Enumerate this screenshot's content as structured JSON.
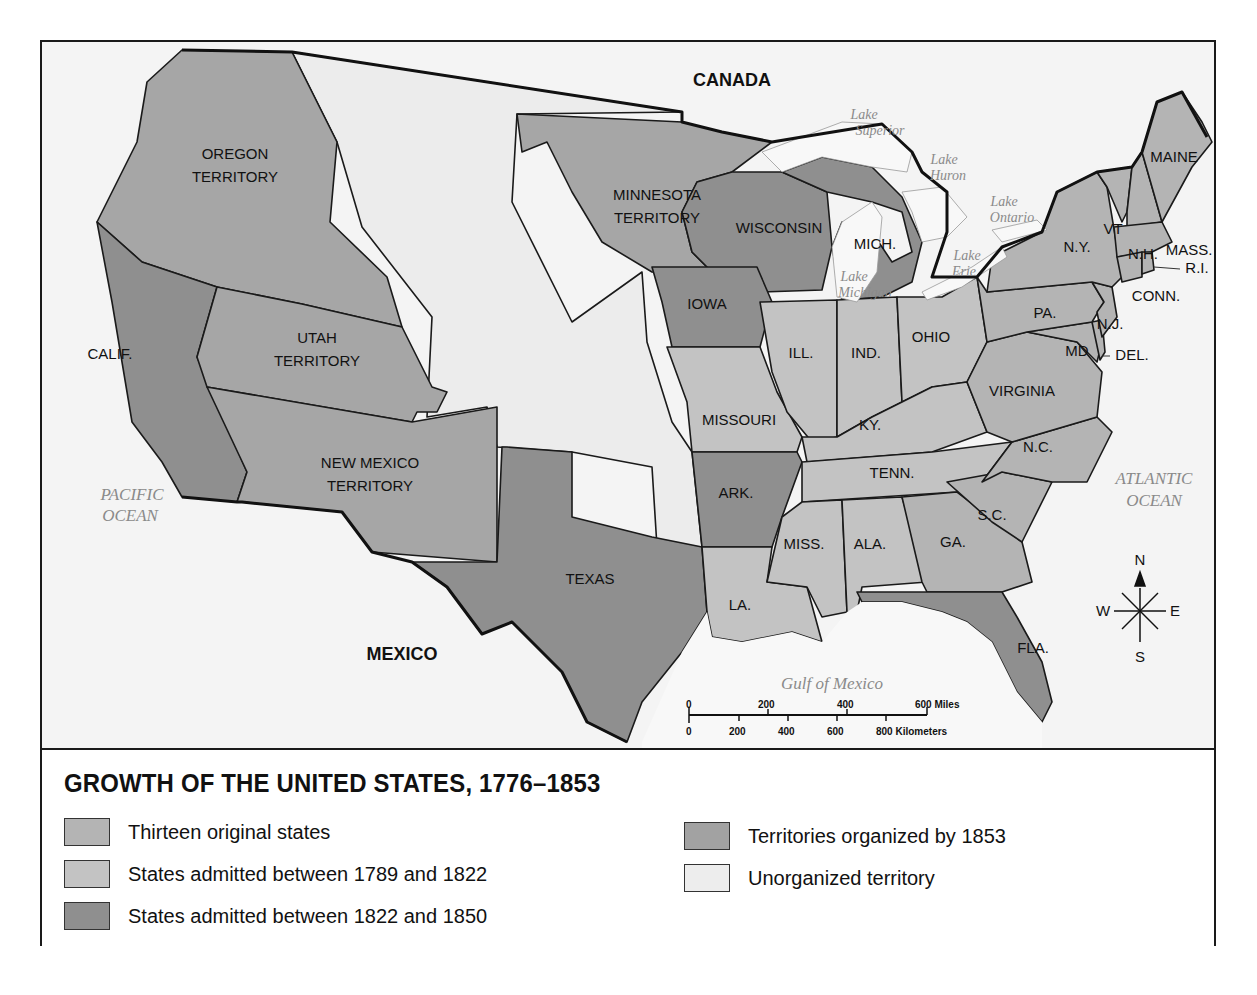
{
  "title": "GROWTH OF THE UNITED STATES, 1776–1853",
  "colors": {
    "thirteen_original": "#b4b4b4",
    "admitted_1789_1822": "#c3c3c3",
    "admitted_1822_1850": "#8f8f8f",
    "territories_1853": "#a2a2a2",
    "unorganized": "#ededed",
    "water": "#f6f6f6",
    "foreign": "#f0f0f0"
  },
  "legend": {
    "items": [
      {
        "label": "Thirteen original states",
        "category": "thirteen_original"
      },
      {
        "label": "States admitted between 1789 and 1822",
        "category": "admitted_1789_1822"
      },
      {
        "label": "States admitted between 1822 and 1850",
        "category": "admitted_1822_1850"
      },
      {
        "label": "Territories organized by 1853",
        "category": "territories_1853"
      },
      {
        "label": "Unorganized territory",
        "category": "unorganized"
      }
    ]
  },
  "map": {
    "countries": {
      "canada": "CANADA",
      "mexico": "MEXICO"
    },
    "water": {
      "pacific": [
        "PACIFIC",
        "OCEAN"
      ],
      "atlantic": [
        "ATLANTIC",
        "OCEAN"
      ],
      "gulf": "Gulf of Mexico",
      "superior": [
        "Lake",
        "Superior"
      ],
      "huron": [
        "Lake",
        "Huron"
      ],
      "ontario": [
        "Lake",
        "Ontario"
      ],
      "erie": [
        "Lake",
        "Erie"
      ],
      "michigan": [
        "Lake",
        "Michigan"
      ]
    },
    "regions": {
      "oregon": [
        "OREGON",
        "TERRITORY"
      ],
      "utah": [
        "UTAH",
        "TERRITORY"
      ],
      "new_mexico": [
        "NEW MEXICO",
        "TERRITORY"
      ],
      "minnesota": [
        "MINNESOTA",
        "TERRITORY"
      ],
      "calif": "CALIF.",
      "texas": "TEXAS",
      "iowa": "IOWA",
      "wisconsin": "WISCONSIN",
      "mich": "MICH.",
      "ark": "ARK.",
      "fla": "FLA.",
      "missouri": "MISSOURI",
      "ill": "ILL.",
      "ind": "IND.",
      "ohio": "OHIO",
      "ky": "KY.",
      "tenn": "TENN.",
      "miss": "MISS.",
      "ala": "ALA.",
      "la": "LA.",
      "maine": "MAINE",
      "vt": "VT",
      "nh": "N.H.",
      "ny": "N.Y.",
      "mass": "MASS.",
      "ri": "R.I.",
      "conn": "CONN.",
      "pa": "PA.",
      "nj": "N.J.",
      "md": "MD",
      "del": "DEL.",
      "virginia": "VIRGINIA",
      "nc": "N.C.",
      "sc": "S.C.",
      "ga": "GA."
    },
    "compass": {
      "n": "N",
      "s": "S",
      "e": "E",
      "w": "W"
    },
    "scale": {
      "miles": [
        "0",
        "200",
        "400",
        "600 Miles"
      ],
      "km": [
        "0",
        "200",
        "400",
        "600",
        "800 Kilometers"
      ]
    }
  }
}
